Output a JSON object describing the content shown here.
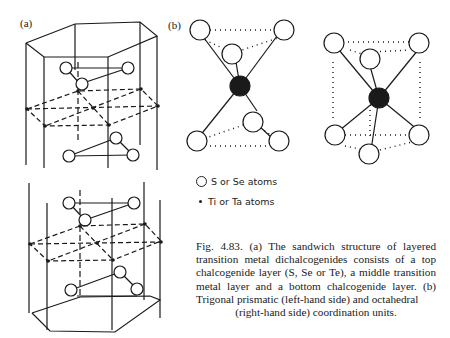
{
  "figure": {
    "panel_a_label": "(a)",
    "panel_b_label": "(b)",
    "legend": {
      "chalcogen": "S or Se atoms",
      "metal": "Ti or Ta atoms"
    },
    "caption": {
      "number": "Fig. 4.83.",
      "body": "(a) The sandwich structure of layered transition metal dichalcogenides consists of a top chalcogenide layer (S, Se or Te), a middle transition metal layer and a bottom chalcogenide layer. (b) Trigonal prismatic (left-hand side) and octahedral",
      "last_line": "(right-hand side) coordination units."
    },
    "colors": {
      "ink": "#1a1a1a",
      "background": "#ffffff"
    }
  }
}
